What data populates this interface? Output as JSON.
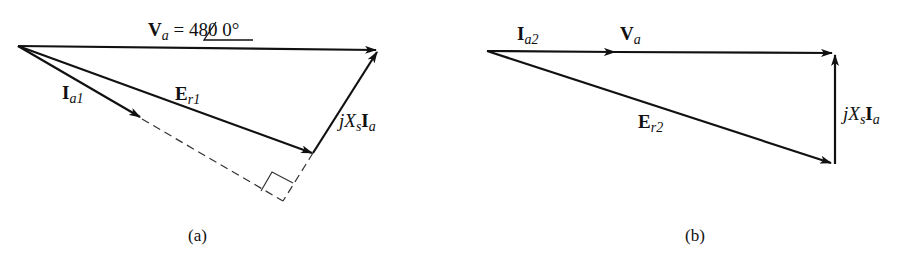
{
  "figure": {
    "panels": [
      {
        "id": "a",
        "caption": "(a)",
        "labels": {
          "va_main": "V",
          "va_sub": "a",
          "va_eq": " = 480 ",
          "va_angle": "0°",
          "ia_main": "I",
          "ia_sub": "a1",
          "er_main": "E",
          "er_sub": "r1",
          "jx_j": "j",
          "jx_x": "X",
          "jx_s": "s",
          "jx_i": "I",
          "jx_a": "a"
        }
      },
      {
        "id": "b",
        "caption": "(b)",
        "labels": {
          "ia_main": "I",
          "ia_sub": "a2",
          "va_main": "V",
          "va_sub": "a",
          "er_main": "E",
          "er_sub": "r2",
          "jx_j": "j",
          "jx_x": "X",
          "jx_s": "s",
          "jx_i": "I",
          "jx_a": "a"
        }
      }
    ],
    "colors": {
      "stroke": "#111111",
      "dashed": "#333333",
      "background": "#ffffff"
    }
  }
}
